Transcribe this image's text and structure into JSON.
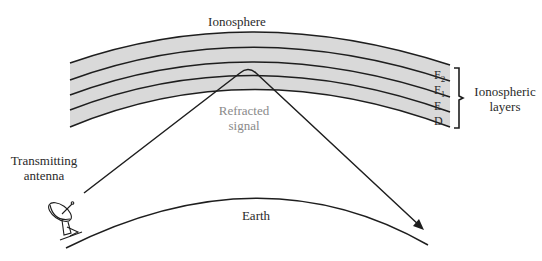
{
  "diagram": {
    "title": "Ionosphere",
    "ionosphere_label": "Ionosphere",
    "layers": [
      {
        "name": "F",
        "sub": "2"
      },
      {
        "name": "F",
        "sub": "1"
      },
      {
        "name": "E",
        "sub": ""
      },
      {
        "name": "D",
        "sub": ""
      }
    ],
    "layers_group_label_line1": "Ionospheric",
    "layers_group_label_line2": "layers",
    "signal_label_line1": "Refracted",
    "signal_label_line2": "signal",
    "antenna_label_line1": "Transmitting",
    "antenna_label_line2": "antenna",
    "earth_label": "Earth",
    "colors": {
      "band_fill": "#d9d9d9",
      "line": "#1e1e1e",
      "signal_label": "#8a8a8a"
    }
  }
}
